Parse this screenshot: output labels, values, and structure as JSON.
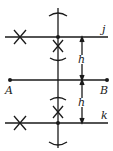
{
  "diagram": {
    "colors": {
      "stroke": "#1a1a1a",
      "background": "#ffffff"
    },
    "labels": {
      "point_a": "A",
      "point_b": "B",
      "line_j": "j",
      "line_k": "k",
      "dim_upper": "h",
      "dim_lower": "h"
    }
  }
}
